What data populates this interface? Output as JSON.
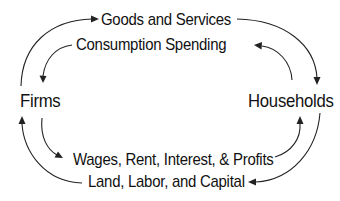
{
  "diagram": {
    "type": "circular-flow",
    "nodes": {
      "firms": "Firms",
      "households": "Households"
    },
    "flows": {
      "goods_and_services": "Goods and Services",
      "consumption_spending": "Consumption Spending",
      "factor_payments": "Wages, Rent, Interest, & Profits",
      "factors_of_production": "Land, Labor, and Capital"
    },
    "edges": [
      {
        "from": "Firms",
        "to": "Households",
        "label": "Goods and Services",
        "position": "top-outer"
      },
      {
        "from": "Households",
        "to": "Firms",
        "label": "Consumption Spending",
        "position": "top-inner"
      },
      {
        "from": "Firms",
        "to": "Households",
        "label": "Wages, Rent, Interest, & Profits",
        "position": "bottom-inner"
      },
      {
        "from": "Households",
        "to": "Firms",
        "label": "Land, Labor, and Capital",
        "position": "bottom-outer"
      }
    ],
    "colors": {
      "text": "#111111",
      "arrow": "#222222",
      "background": "#ffffff"
    }
  }
}
